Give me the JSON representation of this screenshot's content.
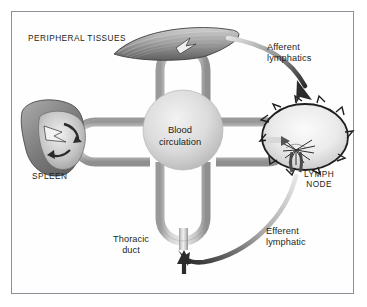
{
  "figure": {
    "border_color": "#8e8e96",
    "background_color": "#fefefe",
    "text_color": "#231f20"
  },
  "labels": {
    "peripheral_tissues": "PERIPHERAL TISSUES",
    "spleen": "SPLEEN",
    "lymph_node": "LYMPH\nNODE",
    "afferent_lymphatics": "Afferent\nlymphatics",
    "efferent_lymphatic": "Efferent\nlymphatic",
    "thoracic_duct": "Thoracic\nduct",
    "blood_circulation": "Blood\ncirculation"
  },
  "icons": {
    "peripheral_tissue": "leaf-tissue-icon",
    "spleen_organ": "spleen-organ-icon",
    "lymph_node_organ": "lymph-node-organ-icon",
    "afferent_arrow": "curved-arrow-down-right-icon",
    "efferent_arrow": "curved-arrow-up-left-icon",
    "thoracic_duct_arrow": "arrow-up-icon",
    "vessel_loop_top": "vessel-loop-icon",
    "vessel_loop_bottom": "vessel-loop-icon",
    "vessel_loop_left": "vessel-loop-icon",
    "vessel_loop_right": "vessel-loop-icon",
    "blood_circulation_hub": "circulation-hub-icon"
  },
  "colors": {
    "vessel_light": "#e6e6e6",
    "vessel_mid": "#b9b9b9",
    "vessel_dark": "#8a8a8a",
    "hub_light": "#e9e9e9",
    "hub_mid": "#cfcfcf",
    "organ_dark": "#6e6e6e",
    "organ_light": "#efefef",
    "arrow_dark": "#2b2b2b",
    "arrow_light": "#d8d8d8",
    "outline": "#3a3a3a"
  }
}
